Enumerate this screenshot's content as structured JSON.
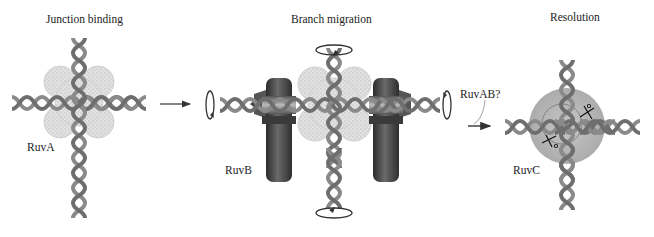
{
  "figure": {
    "stages": [
      {
        "title": "Junction binding",
        "protein_label": "RuvA"
      },
      {
        "title": "Branch migration",
        "protein_label": "RuvB"
      },
      {
        "title": "Resolution",
        "protein_label": "RuvC"
      }
    ],
    "transition_label": "RuvAB?",
    "colors": {
      "dna": "#8a8a8a",
      "dna_dark": "#5e5e5e",
      "ruva": "#d9d9d9",
      "ruvb": "#3c3c3c",
      "ruvc": "#a9a9a9",
      "arrow": "#333333"
    }
  }
}
